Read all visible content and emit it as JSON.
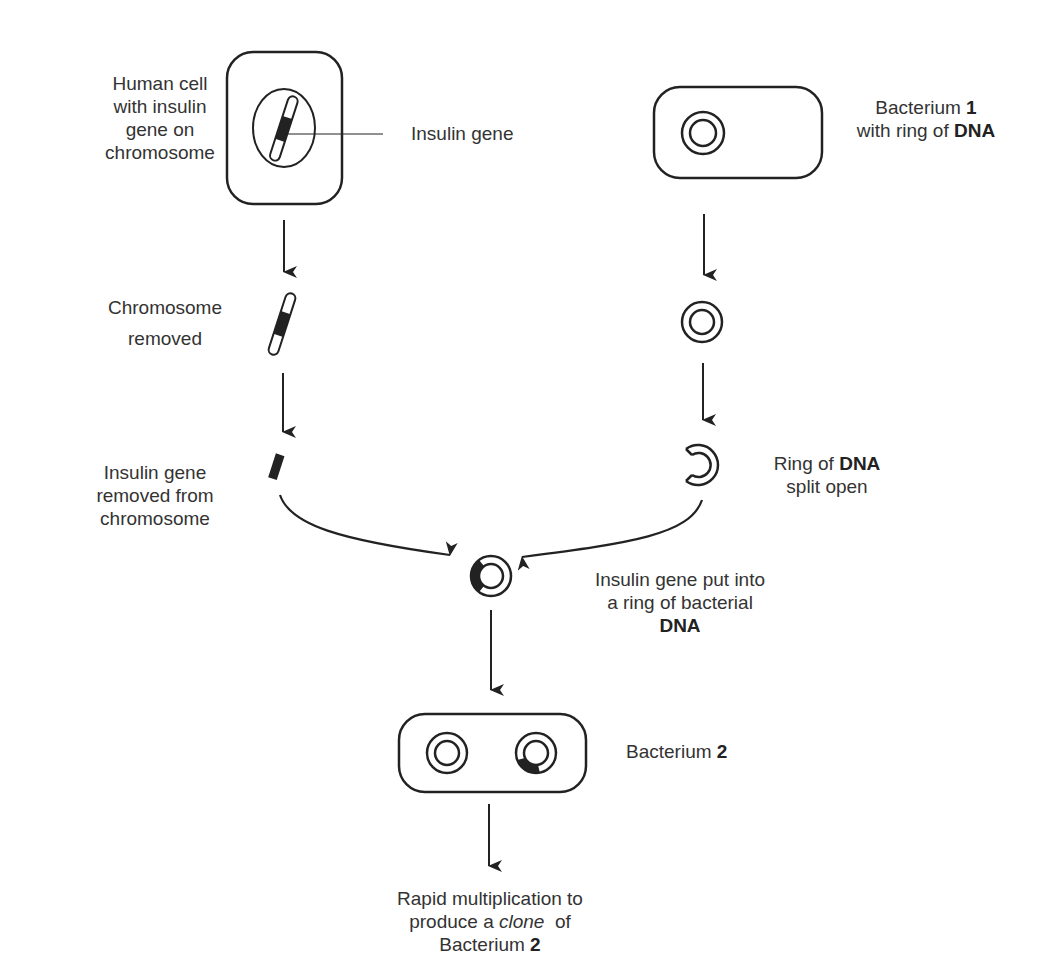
{
  "labels": {
    "human_cell": [
      "Human cell",
      "with insulin",
      "gene on",
      "chromosome"
    ],
    "insulin_gene": "Insulin gene",
    "bacterium1_a": "Bacterium ",
    "bacterium1_num": "1",
    "bacterium1_b": "with ring of ",
    "bacterium1_dna": "DNA",
    "chromosome_removed": [
      "Chromosome",
      "removed"
    ],
    "gene_removed": [
      "Insulin gene",
      "removed from",
      "chromosome"
    ],
    "ring_split_a": "Ring of ",
    "ring_split_dna": "DNA",
    "ring_split_b": "split open",
    "gene_put_a": "Insulin gene put into",
    "gene_put_b": "a ring of bacterial",
    "gene_put_dna": "DNA",
    "bacterium2_a": "Bacterium ",
    "bacterium2_num": "2",
    "clone_a": "Rapid multiplication to",
    "clone_b1": "produce a ",
    "clone_b_italic": "clone",
    "clone_b2": "  of",
    "clone_c": "Bacterium ",
    "clone_num": "2"
  },
  "colors": {
    "line": "#222222",
    "text": "#333333",
    "background": "#ffffff"
  }
}
